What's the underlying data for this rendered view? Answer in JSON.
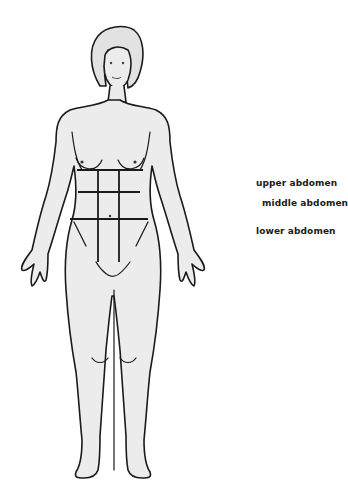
{
  "diagram": {
    "regions": [
      {
        "id": "upper",
        "label": "upper abdomen"
      },
      {
        "id": "middle",
        "label": "middle abdomen"
      },
      {
        "id": "lower",
        "label": "lower abdomen"
      }
    ]
  },
  "colors": {
    "outline": "#1a1a1a",
    "skin": "#ececec",
    "hair": "#e2e2e2",
    "background": "#ffffff"
  }
}
